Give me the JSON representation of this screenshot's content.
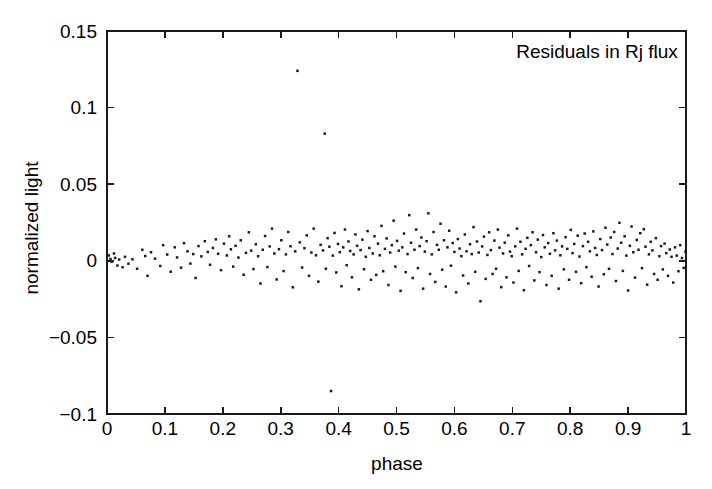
{
  "chart_data": {
    "type": "scatter",
    "title": "",
    "xlabel": "phase",
    "ylabel": "normalized light",
    "xlim": [
      0,
      1
    ],
    "ylim": [
      -0.1,
      0.15
    ],
    "grid": false,
    "legend_position": "top-right",
    "xticks": [
      0,
      0.1,
      0.2,
      0.3,
      0.4,
      0.5,
      0.6,
      0.7,
      0.8,
      0.9,
      1
    ],
    "xticklabels": [
      "0",
      "0.1",
      "0.2",
      "0.3",
      "0.4",
      "0.5",
      "0.6",
      "0.7",
      "0.8",
      "0.9",
      "1"
    ],
    "yticks": [
      -0.1,
      -0.05,
      0,
      0.05,
      0.1,
      0.15
    ],
    "yticklabels": [
      "−0.1",
      "−0.05",
      "0",
      "0.05",
      "0.1",
      "0.15"
    ],
    "marker": "dot",
    "marker_size": 1.25,
    "marker_color": "#1c1c1c",
    "series": [
      {
        "name": "Residuals in Rj flux",
        "x": [
          0.003,
          0.006,
          0.008,
          0.012,
          0.014,
          0.018,
          0.021,
          0.027,
          0.031,
          0.037,
          0.044,
          0.052,
          0.061,
          0.066,
          0.07,
          0.076,
          0.083,
          0.092,
          0.097,
          0.104,
          0.11,
          0.117,
          0.121,
          0.128,
          0.133,
          0.139,
          0.144,
          0.149,
          0.153,
          0.158,
          0.163,
          0.169,
          0.174,
          0.178,
          0.183,
          0.188,
          0.192,
          0.197,
          0.202,
          0.207,
          0.211,
          0.214,
          0.218,
          0.222,
          0.227,
          0.231,
          0.236,
          0.24,
          0.245,
          0.249,
          0.253,
          0.257,
          0.261,
          0.265,
          0.269,
          0.273,
          0.277,
          0.281,
          0.285,
          0.289,
          0.293,
          0.297,
          0.301,
          0.305,
          0.309,
          0.313,
          0.317,
          0.321,
          0.325,
          0.329,
          0.333,
          0.337,
          0.341,
          0.345,
          0.349,
          0.353,
          0.357,
          0.361,
          0.365,
          0.369,
          0.373,
          0.376,
          0.378,
          0.381,
          0.384,
          0.387,
          0.39,
          0.393,
          0.396,
          0.399,
          0.402,
          0.405,
          0.408,
          0.411,
          0.414,
          0.417,
          0.42,
          0.423,
          0.426,
          0.429,
          0.432,
          0.435,
          0.438,
          0.441,
          0.444,
          0.447,
          0.45,
          0.453,
          0.456,
          0.459,
          0.462,
          0.465,
          0.468,
          0.471,
          0.474,
          0.477,
          0.48,
          0.483,
          0.486,
          0.489,
          0.492,
          0.495,
          0.498,
          0.501,
          0.504,
          0.507,
          0.51,
          0.513,
          0.516,
          0.519,
          0.522,
          0.525,
          0.528,
          0.531,
          0.534,
          0.537,
          0.54,
          0.543,
          0.546,
          0.549,
          0.552,
          0.555,
          0.558,
          0.561,
          0.564,
          0.567,
          0.57,
          0.573,
          0.576,
          0.579,
          0.582,
          0.585,
          0.588,
          0.591,
          0.594,
          0.597,
          0.6,
          0.603,
          0.606,
          0.609,
          0.612,
          0.615,
          0.618,
          0.621,
          0.624,
          0.627,
          0.63,
          0.633,
          0.636,
          0.639,
          0.642,
          0.645,
          0.648,
          0.651,
          0.654,
          0.657,
          0.66,
          0.663,
          0.666,
          0.669,
          0.672,
          0.675,
          0.678,
          0.681,
          0.684,
          0.687,
          0.69,
          0.693,
          0.696,
          0.699,
          0.702,
          0.705,
          0.708,
          0.711,
          0.714,
          0.717,
          0.72,
          0.723,
          0.726,
          0.729,
          0.732,
          0.735,
          0.738,
          0.741,
          0.744,
          0.747,
          0.75,
          0.753,
          0.756,
          0.759,
          0.762,
          0.765,
          0.768,
          0.771,
          0.774,
          0.777,
          0.78,
          0.783,
          0.786,
          0.789,
          0.792,
          0.795,
          0.798,
          0.801,
          0.804,
          0.807,
          0.81,
          0.813,
          0.816,
          0.819,
          0.822,
          0.825,
          0.828,
          0.831,
          0.834,
          0.837,
          0.84,
          0.843,
          0.846,
          0.849,
          0.852,
          0.855,
          0.858,
          0.861,
          0.864,
          0.867,
          0.87,
          0.873,
          0.876,
          0.879,
          0.882,
          0.885,
          0.888,
          0.891,
          0.894,
          0.897,
          0.9,
          0.903,
          0.906,
          0.909,
          0.912,
          0.915,
          0.918,
          0.921,
          0.924,
          0.927,
          0.93,
          0.933,
          0.936,
          0.939,
          0.942,
          0.945,
          0.948,
          0.951,
          0.954,
          0.957,
          0.96,
          0.963,
          0.966,
          0.969,
          0.972,
          0.975,
          0.978,
          0.981,
          0.984,
          0.987,
          0.99,
          0.993,
          0.996,
          0.999
        ],
        "y": [
          0.0035,
          0.0012,
          -0.0006,
          0.0048,
          0.0019,
          -0.0031,
          0.0008,
          -0.0042,
          0.0026,
          -0.0019,
          0.001,
          -0.0052,
          0.0072,
          0.0031,
          -0.0098,
          0.0056,
          0.0014,
          -0.0034,
          0.0102,
          0.0041,
          -0.0071,
          0.0088,
          0.0022,
          -0.0045,
          0.0115,
          0.0062,
          -0.0018,
          0.0044,
          -0.0112,
          0.0096,
          0.0029,
          0.0128,
          0.0058,
          -0.0026,
          0.0084,
          0.014,
          0.0046,
          -0.0061,
          0.0112,
          0.0035,
          0.016,
          0.0075,
          -0.0038,
          0.0098,
          0.0021,
          0.0134,
          -0.0091,
          0.0052,
          0.0186,
          0.0066,
          -0.0054,
          0.0108,
          0.003,
          -0.0148,
          0.0072,
          0.0162,
          -0.0041,
          0.0094,
          0.021,
          0.0048,
          -0.0122,
          0.0076,
          0.0134,
          -0.0067,
          0.0042,
          0.0188,
          0.0095,
          -0.0173,
          0.0062,
          0.124,
          0.012,
          -0.0044,
          0.0082,
          0.0166,
          -0.0098,
          0.0054,
          0.021,
          0.0036,
          -0.0136,
          0.0104,
          0.0068,
          0.083,
          -0.0052,
          0.0148,
          0.0092,
          -0.085,
          0.0034,
          0.0182,
          -0.0076,
          0.011,
          0.0056,
          -0.0166,
          0.0088,
          0.0204,
          -0.0029,
          0.0126,
          0.0064,
          -0.0108,
          0.0042,
          0.0172,
          0.0098,
          -0.0186,
          0.007,
          0.0138,
          -0.0055,
          0.0026,
          0.0194,
          0.0084,
          -0.0124,
          0.0048,
          0.016,
          -0.0092,
          0.0112,
          0.0036,
          0.0228,
          -0.0068,
          0.0078,
          0.0146,
          -0.0158,
          0.0054,
          0.0102,
          0.0262,
          -0.0038,
          0.013,
          0.0066,
          -0.0196,
          0.0088,
          0.0178,
          -0.0074,
          0.0044,
          0.0298,
          0.0118,
          -0.0112,
          0.0072,
          0.0204,
          -0.0048,
          0.0096,
          0.0152,
          -0.0182,
          0.006,
          0.0128,
          0.031,
          -0.0086,
          0.0042,
          0.0188,
          -0.0138,
          0.0104,
          0.0072,
          0.0242,
          -0.0058,
          0.0134,
          -0.0168,
          0.0088,
          0.0196,
          -0.0032,
          0.0116,
          0.0058,
          -0.0206,
          0.0142,
          0.008,
          0.003,
          -0.0096,
          0.0172,
          0.0062,
          -0.0148,
          0.0108,
          0.0044,
          0.022,
          -0.0072,
          0.0126,
          0.0054,
          -0.0264,
          0.0094,
          0.0158,
          -0.0118,
          0.0038,
          0.0186,
          0.007,
          -0.0086,
          0.0132,
          -0.0052,
          0.0204,
          0.0086,
          -0.0172,
          0.0048,
          0.0118,
          -0.0108,
          0.0166,
          0.006,
          0.003,
          -0.0142,
          0.0094,
          0.021,
          -0.0066,
          0.0124,
          0.0042,
          -0.0192,
          0.0078,
          0.015,
          -0.0034,
          0.0102,
          0.0186,
          -0.0128,
          0.0056,
          0.0138,
          -0.0074,
          0.0024,
          0.0168,
          0.0088,
          -0.0158,
          0.0116,
          0.0046,
          -0.0098,
          0.018,
          0.0068,
          0.0132,
          -0.0182,
          0.0036,
          0.0094,
          -0.0056,
          0.0154,
          0.0078,
          -0.0124,
          0.0202,
          0.005,
          0.011,
          -0.0072,
          0.0164,
          0.0028,
          -0.0146,
          0.0096,
          0.0178,
          -0.0042,
          0.0124,
          0.0062,
          -0.0104,
          0.0192,
          0.0084,
          0.0038,
          -0.0168,
          0.0142,
          0.007,
          -0.0088,
          0.0216,
          0.0106,
          -0.0052,
          0.0152,
          0.0044,
          0.0188,
          -0.0132,
          0.008,
          0.0248,
          0.0118,
          -0.0066,
          0.016,
          0.0034,
          -0.0194,
          0.0098,
          0.0224,
          0.0056,
          -0.011,
          0.0136,
          0.0072,
          0.018,
          -0.0048,
          0.0206,
          0.0092,
          -0.0156,
          0.0042,
          0.0124,
          0.0068,
          -0.0086,
          0.0148,
          -0.0124,
          0.003,
          0.0096,
          -0.0056,
          0.0112,
          0.005,
          -0.0098,
          0.0074,
          0.0026,
          -0.0142,
          0.0088,
          0.0034,
          -0.0068,
          0.0102,
          0.0018,
          -0.0046,
          0.006
        ]
      }
    ],
    "legend": [
      {
        "label": "Residuals in Rj flux",
        "marker": "dot",
        "color": "#1c1c1c"
      }
    ]
  },
  "plot_geometry": {
    "left": 107,
    "right": 686,
    "top": 31,
    "bottom": 414,
    "tick_length": 7,
    "legend_text_x": 597,
    "legend_text_y": 58,
    "legend_marker_x": 656,
    "legend_marker_y": 57,
    "xlabel_x": 397,
    "xlabel_y": 470,
    "ylabel_x": 38,
    "ylabel_y": 228
  }
}
